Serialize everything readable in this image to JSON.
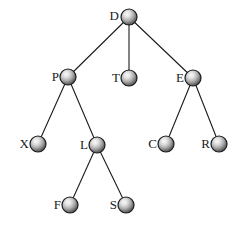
{
  "diagram": {
    "type": "tree",
    "background_color": "#ffffff",
    "node_style": {
      "shape": "sphere",
      "radius": 8,
      "highlight_color": "#f2f2f2",
      "mid_color": "#9a9a9a",
      "edge_color": "#3d3d3d",
      "outline_color": "#1c1c1c",
      "outline_width": 1.2
    },
    "edge_style": {
      "color": "#1c1c1c",
      "width": 1.1
    },
    "label_style": {
      "color": "#1a1a1a",
      "font_size": 13,
      "offset_x": 10
    },
    "nodes": [
      {
        "id": "D",
        "label": "D",
        "x": 129,
        "y": 17,
        "label_x": 111,
        "label_y": 15
      },
      {
        "id": "P",
        "label": "P",
        "x": 68,
        "y": 77,
        "label_x": 51,
        "label_y": 76
      },
      {
        "id": "T",
        "label": "T",
        "x": 129,
        "y": 78,
        "label_x": 112,
        "label_y": 77
      },
      {
        "id": "E",
        "label": "E",
        "x": 193,
        "y": 78,
        "label_x": 176,
        "label_y": 77
      },
      {
        "id": "X",
        "label": "X",
        "x": 38,
        "y": 144,
        "label_x": 21,
        "label_y": 143
      },
      {
        "id": "L",
        "label": "L",
        "x": 97,
        "y": 145,
        "label_x": 80,
        "label_y": 144
      },
      {
        "id": "C",
        "label": "C",
        "x": 166,
        "y": 144,
        "label_x": 149,
        "label_y": 143
      },
      {
        "id": "R",
        "label": "R",
        "x": 219,
        "y": 144,
        "label_x": 202,
        "label_y": 143
      },
      {
        "id": "F",
        "label": "F",
        "x": 70,
        "y": 205,
        "label_x": 53,
        "label_y": 204
      },
      {
        "id": "S",
        "label": "S",
        "x": 126,
        "y": 205,
        "label_x": 109,
        "label_y": 204
      }
    ],
    "edges": [
      {
        "from": "D",
        "to": "P"
      },
      {
        "from": "D",
        "to": "T"
      },
      {
        "from": "D",
        "to": "E"
      },
      {
        "from": "P",
        "to": "X"
      },
      {
        "from": "P",
        "to": "L"
      },
      {
        "from": "E",
        "to": "C"
      },
      {
        "from": "E",
        "to": "R"
      },
      {
        "from": "L",
        "to": "F"
      },
      {
        "from": "L",
        "to": "S"
      }
    ]
  }
}
